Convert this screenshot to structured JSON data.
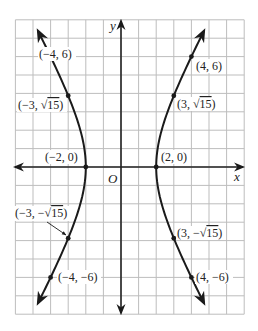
{
  "chart_data": {
    "type": "line",
    "title": "",
    "equation": "x^2/4 - y^2/12 = 1",
    "xlabel": "x",
    "ylabel": "y",
    "origin_label": "O",
    "xlim": [
      -6,
      7
    ],
    "ylim": [
      -8,
      8
    ],
    "grid": true,
    "grid_step": 1,
    "series": [
      {
        "name": "right-branch",
        "points": [
          [
            4,
            -6
          ],
          [
            3,
            -3.873
          ],
          [
            2,
            0
          ],
          [
            3,
            3.873
          ],
          [
            4,
            6
          ]
        ]
      },
      {
        "name": "left-branch",
        "points": [
          [
            -4,
            -6
          ],
          [
            -3,
            -3.873
          ],
          [
            -2,
            0
          ],
          [
            -3,
            3.873
          ],
          [
            -4,
            6
          ]
        ]
      }
    ],
    "annotations": [
      {
        "id": "p1",
        "x": -4,
        "y": 6,
        "label": "(−4, 6)"
      },
      {
        "id": "p2",
        "x": -3,
        "y": 3.873,
        "label": "(−3, √15)"
      },
      {
        "id": "p3",
        "x": -2,
        "y": 0,
        "label": "(−2, 0)"
      },
      {
        "id": "p4",
        "x": -3,
        "y": -3.873,
        "label": "(−3, −√15)"
      },
      {
        "id": "p5",
        "x": -4,
        "y": -6,
        "label": "(−4, −6)"
      },
      {
        "id": "p6",
        "x": 4,
        "y": 6,
        "label": "(4, 6)"
      },
      {
        "id": "p7",
        "x": 3,
        "y": 3.873,
        "label": "(3, √15)"
      },
      {
        "id": "p8",
        "x": 2,
        "y": 0,
        "label": "(2, 0)"
      },
      {
        "id": "p9",
        "x": 3,
        "y": -3.873,
        "label": "(3, −√15)"
      },
      {
        "id": "p10",
        "x": 4,
        "y": -6,
        "label": "(4, −6)"
      }
    ]
  },
  "labels": {
    "x_axis": "x",
    "y_axis": "y",
    "origin": "O",
    "p_m4_6": "(−4, 6)",
    "p_m3_s15_pre": "(−3, ",
    "p_m3_s15_rad": "15",
    "p_m3_s15_post": ")",
    "p_m2_0": "(−2, 0)",
    "p_m3_ms15_pre": "(−3, −",
    "p_m3_ms15_rad": "15",
    "p_m3_ms15_post": ")",
    "p_m4_m6": "(−4, −6)",
    "p_4_6": "(4, 6)",
    "p_3_s15_pre": "(3, ",
    "p_3_s15_rad": "15",
    "p_3_s15_post": ")",
    "p_2_0": "(2, 0)",
    "p_3_ms15_pre": "(3, −",
    "p_3_ms15_rad": "15",
    "p_3_ms15_post": ")",
    "p_4_m6": "(4, −6)"
  },
  "colors": {
    "grid": "#bdbdbd",
    "axis": "#222222",
    "curve": "#1a1a1a",
    "background": "#ffffff"
  }
}
